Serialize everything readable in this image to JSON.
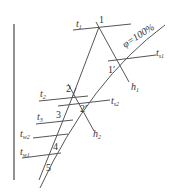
{
  "diagram": {
    "colors": {
      "line": "#555555",
      "text": "#333333",
      "background": "#ffffff"
    },
    "labels": {
      "t1": "t",
      "t1_sub": "1",
      "point1": "1",
      "phi": "φ=100%",
      "point1p": "1′",
      "ts1": "t",
      "ts1_sub": "s1",
      "h1": "h",
      "h1_sub": "1",
      "point2": "2",
      "t2": "t",
      "t2_sub": "2",
      "point2p": "2′",
      "ts2": "t",
      "ts2_sub": "s2",
      "h2": "h",
      "h2_sub": "2",
      "t3": "t",
      "t3_sub": "3",
      "point3": "3",
      "tw2": "t",
      "tw2_sub": "w2",
      "point4": "4",
      "tw1": "t",
      "tw1_sub": "w1",
      "point5": "5"
    }
  }
}
